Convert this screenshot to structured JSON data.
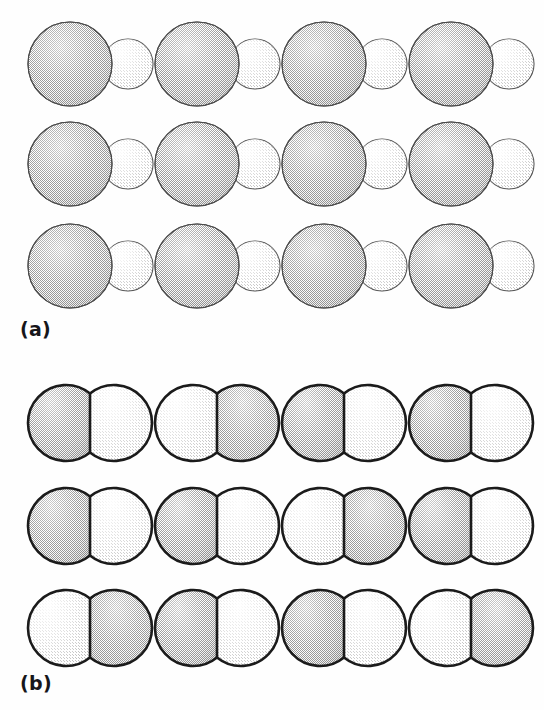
{
  "figure": {
    "type": "scientific-figure-grid",
    "background_color": "#ffffff",
    "width": 544,
    "height": 710,
    "panels": [
      {
        "id": "a",
        "label": "(a)",
        "label_x": 20,
        "label_y": 318,
        "shape_kind": "budding-cell",
        "description": "large stippled mother circle with smaller lighter bud circle on the right",
        "rows": 3,
        "columns": 4,
        "column_x": [
          28,
          155,
          282,
          409
        ],
        "row_y": [
          20,
          120,
          222
        ],
        "outline_color": "#4a4a4a",
        "outline_width": 1.1,
        "big_circle": {
          "cx": 42,
          "cy": 44,
          "r": 42,
          "fill_tone": "dark",
          "fill_color": "#c9c9c9"
        },
        "small_circle": {
          "cx": 100,
          "cy": 44,
          "r": 25,
          "fill_tone": "light",
          "fill_color": "#f2f2f2"
        },
        "cells": [
          {
            "row": 0,
            "col": 0,
            "big_tone": "dark",
            "bud_tone": "light"
          },
          {
            "row": 0,
            "col": 1,
            "big_tone": "dark",
            "bud_tone": "light"
          },
          {
            "row": 0,
            "col": 2,
            "big_tone": "dark",
            "bud_tone": "light"
          },
          {
            "row": 0,
            "col": 3,
            "big_tone": "dark",
            "bud_tone": "light"
          },
          {
            "row": 1,
            "col": 0,
            "big_tone": "dark",
            "bud_tone": "light"
          },
          {
            "row": 1,
            "col": 1,
            "big_tone": "dark",
            "bud_tone": "light"
          },
          {
            "row": 1,
            "col": 2,
            "big_tone": "dark",
            "bud_tone": "light"
          },
          {
            "row": 1,
            "col": 3,
            "big_tone": "dark",
            "bud_tone": "light"
          },
          {
            "row": 2,
            "col": 0,
            "big_tone": "dark",
            "bud_tone": "light"
          },
          {
            "row": 2,
            "col": 1,
            "big_tone": "dark",
            "bud_tone": "light"
          },
          {
            "row": 2,
            "col": 2,
            "big_tone": "dark",
            "bud_tone": "light"
          },
          {
            "row": 2,
            "col": 3,
            "big_tone": "dark",
            "bud_tone": "light"
          }
        ]
      },
      {
        "id": "b",
        "label": "(b)",
        "label_x": 20,
        "label_y": 672,
        "shape_kind": "divided-cell",
        "description": "two equal circles merged side by side with heavy dark outline and vertical septum line; halves alternate dark and light shading",
        "rows": 3,
        "columns": 4,
        "column_x": [
          28,
          155,
          282,
          409
        ],
        "row_y": [
          15,
          118,
          220
        ],
        "outline_color": "#1b1b1b",
        "outline_width": 2.6,
        "septum_width": 2.6,
        "left_circle": {
          "cx": 38,
          "cy": 48,
          "r": 38
        },
        "right_circle": {
          "cx": 86,
          "cy": 48,
          "r": 38
        },
        "fill_dark": "#cbcbcb",
        "fill_light": "#f4f4f4",
        "cells": [
          {
            "row": 0,
            "col": 0,
            "left_tone": "dark",
            "right_tone": "light"
          },
          {
            "row": 0,
            "col": 1,
            "left_tone": "light",
            "right_tone": "dark"
          },
          {
            "row": 0,
            "col": 2,
            "left_tone": "dark",
            "right_tone": "light"
          },
          {
            "row": 0,
            "col": 3,
            "left_tone": "dark",
            "right_tone": "light"
          },
          {
            "row": 1,
            "col": 0,
            "left_tone": "dark",
            "right_tone": "light"
          },
          {
            "row": 1,
            "col": 1,
            "left_tone": "dark",
            "right_tone": "light"
          },
          {
            "row": 1,
            "col": 2,
            "left_tone": "light",
            "right_tone": "dark"
          },
          {
            "row": 1,
            "col": 3,
            "left_tone": "dark",
            "right_tone": "light"
          },
          {
            "row": 2,
            "col": 0,
            "left_tone": "light",
            "right_tone": "dark"
          },
          {
            "row": 2,
            "col": 1,
            "left_tone": "dark",
            "right_tone": "light"
          },
          {
            "row": 2,
            "col": 2,
            "left_tone": "dark",
            "right_tone": "light"
          },
          {
            "row": 2,
            "col": 3,
            "left_tone": "light",
            "right_tone": "dark"
          }
        ]
      }
    ]
  }
}
